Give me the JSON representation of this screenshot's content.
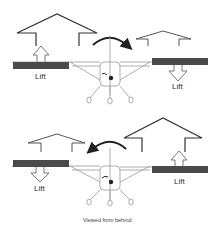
{
  "diagram": {
    "top_panel": {
      "left_lift_label": "Lift",
      "right_lift_label": "Lift",
      "left_wing_lift": "up",
      "right_wing_lift": "down",
      "roll_direction": "clockwise"
    },
    "bottom_panel": {
      "left_lift_label": "Lift",
      "right_lift_label": "Lift",
      "left_wing_lift": "down",
      "right_wing_lift": "up",
      "roll_direction": "counterclockwise"
    },
    "caption": "Viewed from behind",
    "colors": {
      "aileron": "#4a4a4a",
      "line": "#333333",
      "light_line": "#999999"
    }
  }
}
